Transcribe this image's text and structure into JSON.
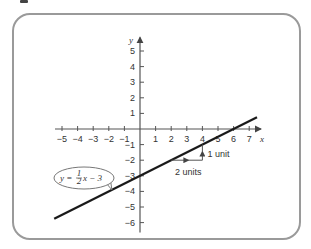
{
  "figure": {
    "type": "coordinate-plane-graph",
    "frame_color": "#9a9a9a",
    "axis_color": "#555555",
    "line_color": "#1a1a1a"
  },
  "chart_data": {
    "type": "line",
    "title": "",
    "xlabel": "x",
    "ylabel": "y",
    "xlim": [
      -5.5,
      7.5
    ],
    "ylim": [
      -6.5,
      6
    ],
    "grid": false,
    "x_ticks": [
      "-5",
      "-4",
      "-3",
      "-2",
      "-1",
      "1",
      "2",
      "3",
      "4",
      "5",
      "6",
      "7"
    ],
    "y_ticks": [
      "5",
      "4",
      "3",
      "2",
      "1",
      "-1",
      "-2",
      "-3",
      "-4",
      "-5",
      "-6"
    ],
    "series": [
      {
        "name": "y = 1/2 x - 3",
        "equation": "y = ½x − 3",
        "slope": 0.5,
        "intercept": -3,
        "x": [
          -5.5,
          7.5
        ],
        "y": [
          -5.75,
          0.75
        ]
      }
    ],
    "annotations": [
      {
        "text": "y = ½x − 3",
        "type": "callout-ellipse",
        "points_to": [
          -1.8,
          -3.9
        ]
      },
      {
        "text": "2 units",
        "type": "run-arrow",
        "from": [
          2,
          -2
        ],
        "to": [
          4,
          -2
        ]
      },
      {
        "text": "1 unit",
        "type": "rise-arrow",
        "from": [
          4,
          -2
        ],
        "to": [
          4,
          -1
        ]
      }
    ]
  },
  "labels": {
    "x_axis": "x",
    "y_axis": "y",
    "callout_eq_left": "y = ",
    "callout_num": "1",
    "callout_den": "2",
    "callout_eq_right": "x − 3",
    "run_label": "2 units",
    "rise_label": "1 unit"
  }
}
